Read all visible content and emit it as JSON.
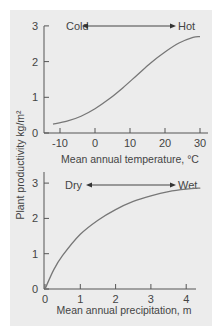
{
  "figure": {
    "ylabel": "Plant productivity kg/m²",
    "panel_color": "#ececec",
    "line_color": "#777777"
  },
  "chart_data": [
    {
      "type": "line",
      "title": "",
      "xlabel": "Mean annual temperature, °C",
      "ylabel": "Plant productivity kg/m²",
      "xticks": [
        "-10",
        "0",
        "10",
        "20",
        "30"
      ],
      "yticks": [
        "0",
        "1",
        "2",
        "3"
      ],
      "xlim": [
        -13,
        32
      ],
      "ylim": [
        0,
        3
      ],
      "grid": false,
      "annotation": {
        "left": "Cold",
        "right": "Hot",
        "type": "double-arrow"
      },
      "series": [
        {
          "name": "productivity",
          "x": [
            -12,
            -8,
            -4,
            0,
            4,
            8,
            12,
            16,
            20,
            24,
            28,
            30
          ],
          "y": [
            0.25,
            0.33,
            0.47,
            0.68,
            0.95,
            1.27,
            1.62,
            1.97,
            2.27,
            2.52,
            2.68,
            2.7
          ]
        }
      ]
    },
    {
      "type": "line",
      "title": "",
      "xlabel": "Mean annual precipitation, m",
      "ylabel": "Plant productivity kg/m²",
      "xticks": [
        "0",
        "1",
        "2",
        "3",
        "4"
      ],
      "yticks": [
        "0",
        "1",
        "2",
        "3"
      ],
      "xlim": [
        0,
        4.5
      ],
      "ylim": [
        0,
        3.3
      ],
      "grid": false,
      "annotation": {
        "left": "Dry",
        "right": "Wet",
        "type": "double-arrow"
      },
      "series": [
        {
          "name": "productivity",
          "x": [
            0,
            0.25,
            0.5,
            1,
            1.5,
            2,
            2.5,
            3,
            3.5,
            4,
            4.4
          ],
          "y": [
            0,
            0.55,
            0.95,
            1.55,
            1.95,
            2.25,
            2.48,
            2.64,
            2.76,
            2.83,
            2.86
          ]
        }
      ]
    }
  ]
}
